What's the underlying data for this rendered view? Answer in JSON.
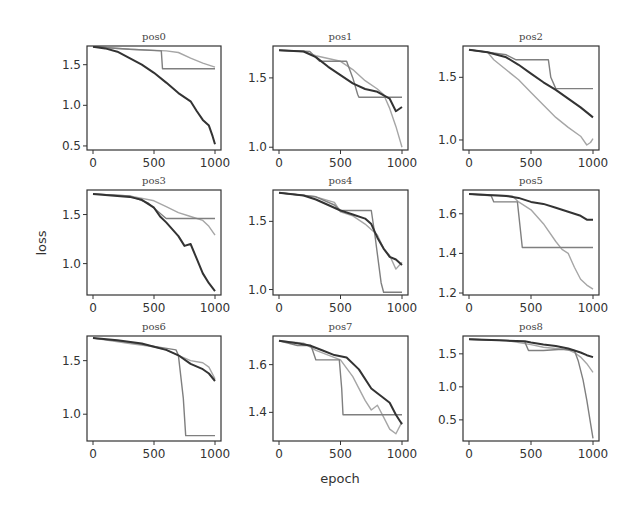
{
  "chart_data": {
    "type": "line",
    "layout": "3x3 grid of subplots",
    "xlabel": "epoch",
    "ylabel": "loss",
    "grid": false,
    "legend": null,
    "series_styles": [
      {
        "name": "series-dark",
        "color": "#333333",
        "width": 2.0
      },
      {
        "name": "series-mid",
        "color": "#7f7f7f",
        "width": 1.4
      },
      {
        "name": "series-light",
        "color": "#a6a6a6",
        "width": 1.4
      }
    ],
    "panels": [
      {
        "title": "pos0",
        "xlim": [
          0,
          1000
        ],
        "ylim": [
          0.45,
          1.73
        ],
        "xticks": [
          0,
          500,
          1000
        ],
        "yticks": [
          0.5,
          1.0,
          1.5
        ],
        "ytick_labels": [
          "0.5",
          "1.0",
          "1.5"
        ],
        "series": [
          {
            "name": "dark",
            "x": [
              0,
              100,
              200,
              300,
              400,
              500,
              600,
              700,
              800,
              850,
              900,
              950,
              980,
              1000
            ],
            "y": [
              1.72,
              1.7,
              1.66,
              1.58,
              1.5,
              1.4,
              1.28,
              1.15,
              1.05,
              0.93,
              0.82,
              0.75,
              0.62,
              0.52
            ]
          },
          {
            "name": "mid",
            "x": [
              0,
              300,
              560,
              570,
              600,
              1000
            ],
            "y": [
              1.72,
              1.69,
              1.67,
              1.45,
              1.45,
              1.45
            ]
          },
          {
            "name": "light",
            "x": [
              0,
              300,
              600,
              700,
              800,
              900,
              1000
            ],
            "y": [
              1.72,
              1.69,
              1.67,
              1.65,
              1.58,
              1.52,
              1.47
            ]
          }
        ]
      },
      {
        "title": "pos1",
        "xlim": [
          0,
          1000
        ],
        "ylim": [
          0.98,
          1.73
        ],
        "xticks": [
          0,
          500,
          1000
        ],
        "yticks": [
          1.0,
          1.5
        ],
        "ytick_labels": [
          "1.0",
          "1.5"
        ],
        "series": [
          {
            "name": "dark",
            "x": [
              0,
              200,
              300,
              400,
              500,
              600,
              700,
              800,
              900,
              950,
              1000
            ],
            "y": [
              1.7,
              1.69,
              1.65,
              1.58,
              1.52,
              1.46,
              1.42,
              1.4,
              1.35,
              1.26,
              1.29
            ]
          },
          {
            "name": "mid",
            "x": [
              0,
              250,
              330,
              550,
              600,
              640,
              650,
              1000
            ],
            "y": [
              1.7,
              1.69,
              1.62,
              1.62,
              1.5,
              1.38,
              1.36,
              1.36
            ]
          },
          {
            "name": "light",
            "x": [
              0,
              200,
              300,
              500,
              600,
              700,
              800,
              850,
              900,
              950,
              1000
            ],
            "y": [
              1.7,
              1.69,
              1.66,
              1.62,
              1.56,
              1.48,
              1.42,
              1.38,
              1.28,
              1.15,
              1.0
            ]
          }
        ]
      },
      {
        "title": "pos2",
        "xlim": [
          0,
          1000
        ],
        "ylim": [
          0.92,
          1.75
        ],
        "xticks": [
          0,
          500,
          1000
        ],
        "yticks": [
          1.0,
          1.5
        ],
        "ytick_labels": [
          "1.0",
          "1.5"
        ],
        "series": [
          {
            "name": "dark",
            "x": [
              0,
              150,
              300,
              400,
              500,
              600,
              700,
              800,
              900,
              950,
              1000
            ],
            "y": [
              1.72,
              1.7,
              1.66,
              1.6,
              1.53,
              1.46,
              1.4,
              1.33,
              1.26,
              1.22,
              1.18
            ]
          },
          {
            "name": "mid",
            "x": [
              0,
              300,
              380,
              640,
              660,
              700,
              1000
            ],
            "y": [
              1.72,
              1.68,
              1.64,
              1.64,
              1.5,
              1.41,
              1.41
            ]
          },
          {
            "name": "light",
            "x": [
              0,
              150,
              200,
              300,
              400,
              500,
              600,
              700,
              800,
              900,
              950,
              980,
              1000
            ],
            "y": [
              1.72,
              1.7,
              1.64,
              1.56,
              1.48,
              1.38,
              1.28,
              1.18,
              1.1,
              1.03,
              0.96,
              0.98,
              1.01
            ]
          }
        ]
      },
      {
        "title": "pos3",
        "xlim": [
          0,
          1000
        ],
        "ylim": [
          0.68,
          1.75
        ],
        "xticks": [
          0,
          500,
          1000
        ],
        "yticks": [
          1.0,
          1.5
        ],
        "ytick_labels": [
          "1.0",
          "1.5"
        ],
        "series": [
          {
            "name": "dark",
            "x": [
              0,
              200,
              300,
              400,
              500,
              550,
              600,
              700,
              750,
              800,
              850,
              900,
              950,
              1000
            ],
            "y": [
              1.71,
              1.69,
              1.68,
              1.65,
              1.57,
              1.48,
              1.42,
              1.28,
              1.18,
              1.2,
              1.05,
              0.9,
              0.8,
              0.72
            ]
          },
          {
            "name": "mid",
            "x": [
              0,
              300,
              450,
              580,
              600,
              1000
            ],
            "y": [
              1.71,
              1.69,
              1.62,
              1.48,
              1.46,
              1.46
            ]
          },
          {
            "name": "light",
            "x": [
              0,
              300,
              500,
              600,
              700,
              800,
              900,
              950,
              1000
            ],
            "y": [
              1.71,
              1.69,
              1.64,
              1.58,
              1.52,
              1.48,
              1.44,
              1.38,
              1.29
            ]
          }
        ]
      },
      {
        "title": "pos4",
        "xlim": [
          0,
          1000
        ],
        "ylim": [
          0.96,
          1.73
        ],
        "xticks": [
          0,
          500,
          1000
        ],
        "yticks": [
          1.0,
          1.5
        ],
        "ytick_labels": [
          "1.0",
          "1.5"
        ],
        "series": [
          {
            "name": "dark",
            "x": [
              0,
              200,
              300,
              400,
              500,
              600,
              700,
              750,
              800,
              850,
              900,
              950,
              1000
            ],
            "y": [
              1.71,
              1.69,
              1.66,
              1.62,
              1.58,
              1.55,
              1.52,
              1.48,
              1.38,
              1.3,
              1.24,
              1.22,
              1.18
            ]
          },
          {
            "name": "mid",
            "x": [
              0,
              300,
              450,
              500,
              750,
              780,
              830,
              850,
              1000
            ],
            "y": [
              1.71,
              1.68,
              1.62,
              1.58,
              1.58,
              1.4,
              1.05,
              0.98,
              0.98
            ]
          },
          {
            "name": "light",
            "x": [
              0,
              300,
              450,
              500,
              600,
              700,
              800,
              850,
              900,
              950,
              1000
            ],
            "y": [
              1.71,
              1.68,
              1.64,
              1.57,
              1.54,
              1.48,
              1.4,
              1.3,
              1.25,
              1.15,
              1.2
            ]
          }
        ]
      },
      {
        "title": "pos5",
        "xlim": [
          0,
          1000
        ],
        "ylim": [
          1.19,
          1.72
        ],
        "xticks": [
          0,
          500,
          1000
        ],
        "yticks": [
          1.2,
          1.4,
          1.6
        ],
        "ytick_labels": [
          "1.2",
          "1.4",
          "1.6"
        ],
        "series": [
          {
            "name": "dark",
            "x": [
              0,
              300,
              400,
              500,
              600,
              700,
              800,
              900,
              950,
              1000
            ],
            "y": [
              1.7,
              1.69,
              1.68,
              1.66,
              1.65,
              1.63,
              1.61,
              1.59,
              1.57,
              1.57
            ]
          },
          {
            "name": "mid",
            "x": [
              0,
              180,
              200,
              390,
              430,
              1000
            ],
            "y": [
              1.7,
              1.69,
              1.66,
              1.66,
              1.43,
              1.43
            ]
          },
          {
            "name": "light",
            "x": [
              0,
              350,
              400,
              500,
              600,
              700,
              750,
              800,
              850,
              900,
              950,
              1000
            ],
            "y": [
              1.7,
              1.69,
              1.66,
              1.62,
              1.55,
              1.46,
              1.42,
              1.4,
              1.33,
              1.27,
              1.24,
              1.22
            ]
          }
        ]
      },
      {
        "title": "pos6",
        "xlim": [
          0,
          1000
        ],
        "ylim": [
          0.75,
          1.73
        ],
        "xticks": [
          0,
          500,
          1000
        ],
        "yticks": [
          1.0,
          1.5
        ],
        "ytick_labels": [
          "1.0",
          "1.5"
        ],
        "series": [
          {
            "name": "dark",
            "x": [
              0,
              200,
              400,
              500,
              600,
              700,
              800,
              900,
              950,
              1000
            ],
            "y": [
              1.71,
              1.69,
              1.66,
              1.63,
              1.6,
              1.55,
              1.47,
              1.42,
              1.38,
              1.31
            ]
          },
          {
            "name": "mid",
            "x": [
              0,
              300,
              680,
              700,
              740,
              760,
              1000
            ],
            "y": [
              1.71,
              1.67,
              1.6,
              1.55,
              1.15,
              0.8,
              0.8
            ]
          },
          {
            "name": "light",
            "x": [
              0,
              300,
              500,
              600,
              700,
              800,
              900,
              950,
              1000
            ],
            "y": [
              1.71,
              1.66,
              1.63,
              1.6,
              1.55,
              1.5,
              1.48,
              1.44,
              1.33
            ]
          }
        ]
      },
      {
        "title": "pos7",
        "xlim": [
          0,
          1000
        ],
        "ylim": [
          1.28,
          1.72
        ],
        "xticks": [
          0,
          500,
          1000
        ],
        "yticks": [
          1.4,
          1.6
        ],
        "ytick_labels": [
          "1.4",
          "1.6"
        ],
        "series": [
          {
            "name": "dark",
            "x": [
              0,
              150,
              250,
              350,
              450,
              550,
              650,
              750,
              800,
              850,
              900,
              950,
              1000
            ],
            "y": [
              1.7,
              1.69,
              1.68,
              1.66,
              1.64,
              1.63,
              1.58,
              1.5,
              1.48,
              1.46,
              1.44,
              1.39,
              1.35
            ]
          },
          {
            "name": "mid",
            "x": [
              0,
              150,
              260,
              300,
              490,
              510,
              520,
              1000
            ],
            "y": [
              1.7,
              1.68,
              1.68,
              1.62,
              1.62,
              1.5,
              1.39,
              1.39
            ]
          },
          {
            "name": "light",
            "x": [
              0,
              200,
              300,
              400,
              500,
              600,
              700,
              750,
              800,
              850,
              900,
              950,
              1000
            ],
            "y": [
              1.7,
              1.69,
              1.66,
              1.64,
              1.62,
              1.55,
              1.45,
              1.41,
              1.43,
              1.38,
              1.33,
              1.31,
              1.36
            ]
          }
        ]
      },
      {
        "title": "pos8",
        "xlim": [
          0,
          1000
        ],
        "ylim": [
          0.18,
          1.77
        ],
        "xticks": [
          0,
          500,
          1000
        ],
        "yticks": [
          0.5,
          1.0,
          1.5
        ],
        "ytick_labels": [
          "0.5",
          "1.0",
          "1.5"
        ],
        "series": [
          {
            "name": "dark",
            "x": [
              0,
              300,
              450,
              500,
              600,
              700,
              800,
              900,
              950,
              1000
            ],
            "y": [
              1.72,
              1.7,
              1.69,
              1.67,
              1.64,
              1.62,
              1.58,
              1.52,
              1.48,
              1.45
            ]
          },
          {
            "name": "mid",
            "x": [
              0,
              300,
              450,
              480,
              600,
              750,
              850,
              880,
              920,
              950,
              980,
              1000
            ],
            "y": [
              1.72,
              1.7,
              1.68,
              1.55,
              1.55,
              1.57,
              1.55,
              1.4,
              1.1,
              0.8,
              0.45,
              0.22
            ]
          },
          {
            "name": "light",
            "x": [
              0,
              300,
              500,
              600,
              700,
              800,
              850,
              900,
              950,
              1000
            ],
            "y": [
              1.72,
              1.7,
              1.64,
              1.6,
              1.58,
              1.56,
              1.52,
              1.45,
              1.35,
              1.22
            ]
          }
        ]
      }
    ]
  }
}
